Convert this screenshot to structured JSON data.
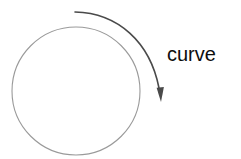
{
  "figure": {
    "background_color": "#ffffff",
    "width": 241,
    "height": 159,
    "label": {
      "text": "curve",
      "color": "#0d0d0d",
      "x": 167,
      "y": 44
    },
    "circle": {
      "name": "outline-circle",
      "center_x": 76,
      "center_y": 91,
      "radius": 64,
      "stroke_color": "#9a9a9a",
      "stroke_width": 1,
      "fill": "none"
    },
    "arrow": {
      "name": "curved-arrow",
      "stroke_color": "#4a4a4a",
      "stroke_width": 1.6,
      "start_x": 75,
      "start_y": 12,
      "end_x": 161,
      "end_y": 101,
      "head_color": "#4a4a4a",
      "head_length": 13,
      "head_width": 7,
      "direction": "clockwise"
    }
  }
}
